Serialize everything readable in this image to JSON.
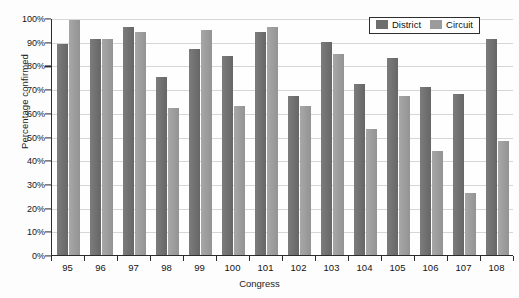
{
  "chart_data": {
    "type": "bar",
    "title": "",
    "xlabel": "Congress",
    "ylabel": "Percentage confirmed",
    "ylim": [
      0,
      100
    ],
    "ytick_labels": [
      "0%",
      "10%",
      "20%",
      "30%",
      "40%",
      "50%",
      "60%",
      "70%",
      "80%",
      "90%",
      "100%"
    ],
    "ytick_values": [
      0,
      10,
      20,
      30,
      40,
      50,
      60,
      70,
      80,
      90,
      100
    ],
    "grid": true,
    "legend_position": "top-right",
    "categories": [
      "95",
      "96",
      "97",
      "98",
      "99",
      "100",
      "101",
      "102",
      "103",
      "104",
      "105",
      "106",
      "107",
      "108"
    ],
    "series": [
      {
        "name": "District",
        "color": "#6d6d6d",
        "values": [
          89,
          91,
          96,
          75,
          87,
          84,
          94,
          67,
          90,
          72,
          83,
          71,
          68,
          91
        ]
      },
      {
        "name": "Circuit",
        "color": "#9b9b9b",
        "values": [
          99,
          91,
          94,
          62,
          95,
          63,
          96,
          63,
          85,
          53,
          67,
          44,
          26,
          48
        ]
      }
    ]
  },
  "legend": {
    "entries": [
      {
        "label": "District",
        "swatch": "district-swatch"
      },
      {
        "label": "Circuit",
        "swatch": "circuit-swatch"
      }
    ]
  }
}
